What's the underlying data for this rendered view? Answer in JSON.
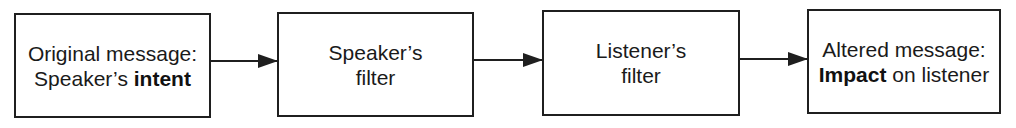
{
  "diagram": {
    "type": "flowchart",
    "direction": "left-to-right",
    "nodes": [
      {
        "id": "original",
        "lines": [
          [
            {
              "text": "Original message:",
              "bold": false
            }
          ],
          [
            {
              "text": "Speaker’s ",
              "bold": false
            },
            {
              "text": "intent",
              "bold": true
            }
          ]
        ]
      },
      {
        "id": "speaker-filter",
        "lines": [
          [
            {
              "text": "Speaker’s",
              "bold": false
            }
          ],
          [
            {
              "text": "filter",
              "bold": false
            }
          ]
        ]
      },
      {
        "id": "listener-filter",
        "lines": [
          [
            {
              "text": "Listener’s",
              "bold": false
            }
          ],
          [
            {
              "text": "filter",
              "bold": false
            }
          ]
        ]
      },
      {
        "id": "altered",
        "lines": [
          [
            {
              "text": "Altered message:",
              "bold": false
            }
          ],
          [
            {
              "text": "Impact",
              "bold": true
            },
            {
              "text": " on listener",
              "bold": false
            }
          ]
        ]
      }
    ],
    "edges": [
      {
        "from": "original",
        "to": "speaker-filter"
      },
      {
        "from": "speaker-filter",
        "to": "listener-filter"
      },
      {
        "from": "listener-filter",
        "to": "altered"
      }
    ]
  },
  "labels": {
    "box1": {
      "l1": "Original message:",
      "l2a": "Speaker’s ",
      "l2b": "intent"
    },
    "box2": {
      "l1": "Speaker’s",
      "l2": "filter"
    },
    "box3": {
      "l1": "Listener’s",
      "l2": "filter"
    },
    "box4": {
      "l1": "Altered message:",
      "l2a": "Impact",
      "l2b": " on listener"
    }
  },
  "colors": {
    "stroke": "#1f1f1f",
    "background": "#ffffff",
    "text": "#1a1a1a"
  }
}
